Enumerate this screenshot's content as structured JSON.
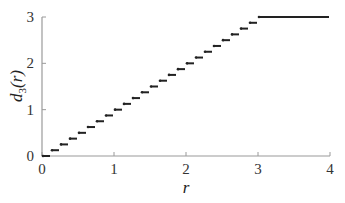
{
  "chart_data": {
    "type": "line",
    "subtype": "step",
    "title": "",
    "xlabel": "r",
    "ylabel": "d_3(r)",
    "ylabel_parts": {
      "base": "d",
      "sub": "3",
      "arg": "(r)"
    },
    "xlim": [
      0,
      4
    ],
    "ylim": [
      0,
      3
    ],
    "x_ticks": [
      0,
      1,
      2,
      3,
      4
    ],
    "y_ticks": [
      0,
      1,
      2,
      3
    ],
    "x_tick_labels": [
      "0",
      "1",
      "2",
      "3",
      "4"
    ],
    "y_tick_labels": [
      "0",
      "1",
      "2",
      "3"
    ],
    "grid": false,
    "legend": null,
    "step_width": 0.125,
    "series": [
      {
        "name": "d3(r)",
        "color": "#222222",
        "segments": [
          {
            "x0": 0.0,
            "x1": 0.125,
            "y": 0.0
          },
          {
            "x0": 0.125,
            "x1": 0.25,
            "y": 0.125
          },
          {
            "x0": 0.25,
            "x1": 0.375,
            "y": 0.25
          },
          {
            "x0": 0.375,
            "x1": 0.5,
            "y": 0.375
          },
          {
            "x0": 0.5,
            "x1": 0.625,
            "y": 0.5
          },
          {
            "x0": 0.625,
            "x1": 0.75,
            "y": 0.625
          },
          {
            "x0": 0.75,
            "x1": 0.875,
            "y": 0.75
          },
          {
            "x0": 0.875,
            "x1": 1.0,
            "y": 0.875
          },
          {
            "x0": 1.0,
            "x1": 1.125,
            "y": 1.0
          },
          {
            "x0": 1.125,
            "x1": 1.25,
            "y": 1.125
          },
          {
            "x0": 1.25,
            "x1": 1.375,
            "y": 1.25
          },
          {
            "x0": 1.375,
            "x1": 1.5,
            "y": 1.375
          },
          {
            "x0": 1.5,
            "x1": 1.625,
            "y": 1.5
          },
          {
            "x0": 1.625,
            "x1": 1.75,
            "y": 1.625
          },
          {
            "x0": 1.75,
            "x1": 1.875,
            "y": 1.75
          },
          {
            "x0": 1.875,
            "x1": 2.0,
            "y": 1.875
          },
          {
            "x0": 2.0,
            "x1": 2.125,
            "y": 2.0
          },
          {
            "x0": 2.125,
            "x1": 2.25,
            "y": 2.125
          },
          {
            "x0": 2.25,
            "x1": 2.375,
            "y": 2.25
          },
          {
            "x0": 2.375,
            "x1": 2.5,
            "y": 2.375
          },
          {
            "x0": 2.5,
            "x1": 2.625,
            "y": 2.5
          },
          {
            "x0": 2.625,
            "x1": 2.75,
            "y": 2.625
          },
          {
            "x0": 2.75,
            "x1": 2.875,
            "y": 2.75
          },
          {
            "x0": 2.875,
            "x1": 3.0,
            "y": 2.875
          },
          {
            "x0": 3.0,
            "x1": 4.0,
            "y": 3.0
          }
        ]
      }
    ]
  },
  "layout": {
    "plot_left": 42,
    "plot_right": 330,
    "plot_top": 17,
    "plot_bottom": 156
  }
}
